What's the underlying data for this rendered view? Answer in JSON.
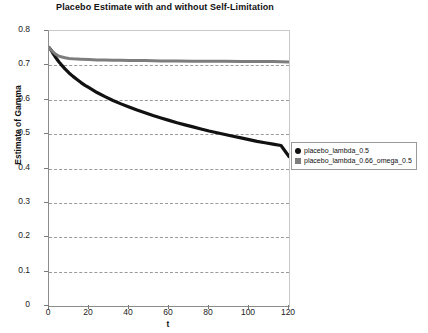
{
  "chart_data": {
    "type": "line",
    "title": "Placebo Estimate with and without Self-Limitation",
    "xlabel": "t",
    "ylabel": "Estimate of Gamma",
    "xlim": [
      0,
      120
    ],
    "ylim": [
      0,
      0.8
    ],
    "xticks": [
      0,
      20,
      40,
      60,
      80,
      100,
      120
    ],
    "xtick_labels": [
      "0",
      "20",
      "40",
      "60",
      "80",
      "100",
      "120"
    ],
    "yticks": [
      0,
      0.1,
      0.2,
      0.3,
      0.4,
      0.5,
      0.6,
      0.7,
      0.8
    ],
    "ytick_labels": [
      "0",
      "0.1",
      "0.2",
      "0.3",
      "0.4",
      "0.5",
      "0.6",
      "0.7",
      "0.8"
    ],
    "grid": "horizontal-dashed",
    "legend_position": "right",
    "series": [
      {
        "name": "placebo_lambda_0.5",
        "color": "#111111",
        "marker": "dot",
        "x": [
          0,
          1,
          2,
          3,
          4,
          5,
          6,
          8,
          10,
          12,
          14,
          16,
          18,
          20,
          24,
          28,
          32,
          36,
          40,
          44,
          48,
          52,
          56,
          60,
          64,
          68,
          72,
          76,
          80,
          84,
          88,
          92,
          96,
          100,
          104,
          108,
          112,
          116,
          120
        ],
        "y": [
          0.752,
          0.745,
          0.735,
          0.726,
          0.718,
          0.71,
          0.703,
          0.69,
          0.678,
          0.668,
          0.659,
          0.65,
          0.642,
          0.635,
          0.621,
          0.609,
          0.598,
          0.588,
          0.579,
          0.57,
          0.562,
          0.554,
          0.547,
          0.54,
          0.533,
          0.527,
          0.521,
          0.515,
          0.509,
          0.504,
          0.499,
          0.494,
          0.489,
          0.484,
          0.479,
          0.475,
          0.471,
          0.467,
          0.435
        ]
      },
      {
        "name": "placebo_lambda_0.66_omega_0.5",
        "color": "#7d7d7d",
        "marker": "square",
        "x": [
          0,
          1,
          2,
          3,
          4,
          5,
          6,
          8,
          10,
          12,
          16,
          20,
          24,
          28,
          32,
          36,
          40,
          48,
          56,
          64,
          72,
          80,
          88,
          96,
          104,
          112,
          120
        ],
        "y": [
          0.752,
          0.745,
          0.739,
          0.734,
          0.73,
          0.727,
          0.725,
          0.722,
          0.72,
          0.719,
          0.718,
          0.717,
          0.716,
          0.716,
          0.715,
          0.715,
          0.714,
          0.714,
          0.713,
          0.713,
          0.712,
          0.712,
          0.712,
          0.711,
          0.711,
          0.711,
          0.71
        ]
      }
    ]
  }
}
